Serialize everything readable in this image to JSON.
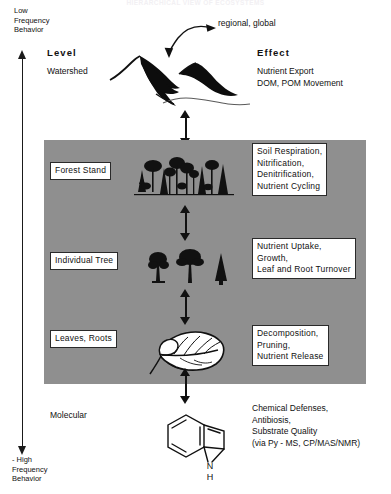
{
  "title": "HIERARCHICAL VIEW OF ECOSYSTEMS",
  "axis": {
    "top_label": "Low\nFrequency\nBehavior",
    "bottom_label": "- High\nFrequency\nBehavior",
    "up_arrow_icon": "arrow-up-icon",
    "down_arrow_icon": "arrow-down-icon"
  },
  "columns": {
    "level_header": "Level",
    "effect_header": "Effect"
  },
  "top_annotation": {
    "text": "regional,  global",
    "arrow_icon": "curved-double-arrow-icon"
  },
  "rows": [
    {
      "level": "Watershed",
      "level_boxed": false,
      "effect": "Nutrient  Export\nDOM, POM Movement",
      "effect_boxed": false,
      "icon": "mountain-watershed-icon"
    },
    {
      "level": "Forest  Stand",
      "level_boxed": true,
      "effect": "Soil  Respiration,\nNitrification,\nDenitrification,\nNutrient  Cycling",
      "effect_boxed": true,
      "icon": "forest-stand-trees-icon"
    },
    {
      "level": "Individual  Tree",
      "level_boxed": true,
      "effect": "Nutrient  Uptake,\nGrowth,\nLeaf and Root Turnover",
      "effect_boxed": true,
      "icon": "individual-trees-icon"
    },
    {
      "level": "Leaves,  Roots",
      "level_boxed": true,
      "effect": "Decomposition,\nPruning,\nNutrient  Release",
      "effect_boxed": true,
      "icon": "leaf-icon"
    },
    {
      "level": "Molecular",
      "level_boxed": false,
      "effect": "Chemical  Defenses,\nAntibiosis,\nSubstrate  Quality\n(via Py - MS, CP/MAS/NMR)",
      "effect_boxed": false,
      "icon": "indole-molecule-icon"
    }
  ],
  "molecule": {
    "nitrogen_label": "N",
    "hydrogen_label": "H"
  },
  "colors": {
    "panel_gray": "#8f8f8f",
    "ink": "#111111",
    "paper": "#ffffff"
  }
}
